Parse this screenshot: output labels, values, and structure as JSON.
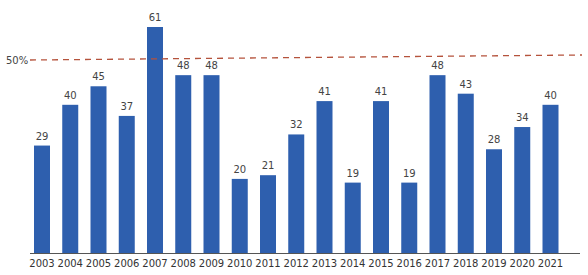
{
  "chart_data": {
    "type": "bar",
    "title": "",
    "xlabel": "",
    "ylabel": "",
    "categories": [
      "2003",
      "2004",
      "2005",
      "2006",
      "2007",
      "2008",
      "2009",
      "2010",
      "2011",
      "2012",
      "2013",
      "2014",
      "2015",
      "2016",
      "2017",
      "2018",
      "2019",
      "2020",
      "2021"
    ],
    "values": [
      29,
      40,
      45,
      37,
      61,
      48,
      48,
      20,
      21,
      32,
      41,
      19,
      41,
      19,
      48,
      43,
      28,
      34,
      40
    ],
    "ylim": [
      0,
      61
    ],
    "grid": false,
    "legend": null,
    "reference_line": {
      "label": "50%",
      "style": "dashed",
      "color": "#b5533c"
    },
    "bar_color": "#2e5fae",
    "data_labels": true
  }
}
